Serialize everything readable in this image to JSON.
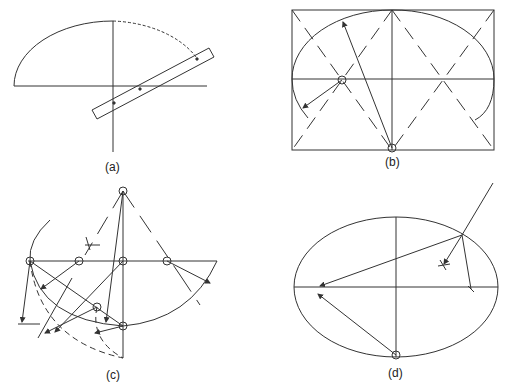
{
  "figure": {
    "panels": [
      {
        "id": "a",
        "caption": "(a)",
        "description": "Trammel method: paper strip ruler marked with points plotting an elliptical arc over a quadrant"
      },
      {
        "id": "b",
        "caption": "(b)",
        "description": "Four-centre approximate ellipse inside a rectangle with diagonals and compass centres"
      },
      {
        "id": "c",
        "caption": "(c)",
        "description": "Construction of an elliptical arc using multiple centres along a major axis with radiating arrows"
      },
      {
        "id": "d",
        "caption": "(d)",
        "description": "Ellipse with major and minor axes, tangent/normal construction at a point on the curve"
      }
    ]
  },
  "colors": {
    "line": "#333333",
    "background": "#ffffff"
  }
}
